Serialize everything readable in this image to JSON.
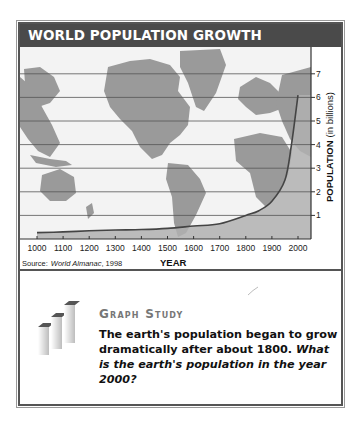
{
  "header": {
    "title": "WORLD POPULATION GROWTH"
  },
  "chart_data": {
    "type": "area",
    "title": "World Population Growth",
    "xlabel": "YEAR",
    "ylabel": "POPULATION (in billions)",
    "ylabel_bold": "POPULATION",
    "ylabel_unit": "(in billions)",
    "x": [
      1000,
      1100,
      1200,
      1300,
      1400,
      1500,
      1600,
      1700,
      1800,
      1850,
      1900,
      1950,
      1975,
      2000
    ],
    "values": [
      0.27,
      0.3,
      0.35,
      0.38,
      0.4,
      0.45,
      0.55,
      0.65,
      1.0,
      1.2,
      1.6,
      2.5,
      4.0,
      6.1
    ],
    "x_ticks": [
      "1000",
      "1100",
      "1200",
      "1300",
      "1400",
      "1500",
      "1600",
      "1700",
      "1800",
      "1900",
      "2000"
    ],
    "y_ticks": [
      "1",
      "2",
      "3",
      "4",
      "5",
      "6",
      "7"
    ],
    "xlim": [
      1000,
      2000
    ],
    "ylim": [
      0,
      8
    ],
    "grid": true,
    "background": "world map",
    "source": "Source:",
    "source_title": "World Almanac",
    "source_year": ", 1998"
  },
  "study": {
    "heading": "Graph Study",
    "statement": "The earth's population began to grow dramatically after about 1800.",
    "question": "What is the earth's population in the year 2000?"
  },
  "colors": {
    "title_bar": "#4a4a4a",
    "map_land": "#9a9a9a",
    "map_water": "#f3f3f3",
    "area_fill": "#b8b8b8",
    "curve": "#444444"
  }
}
